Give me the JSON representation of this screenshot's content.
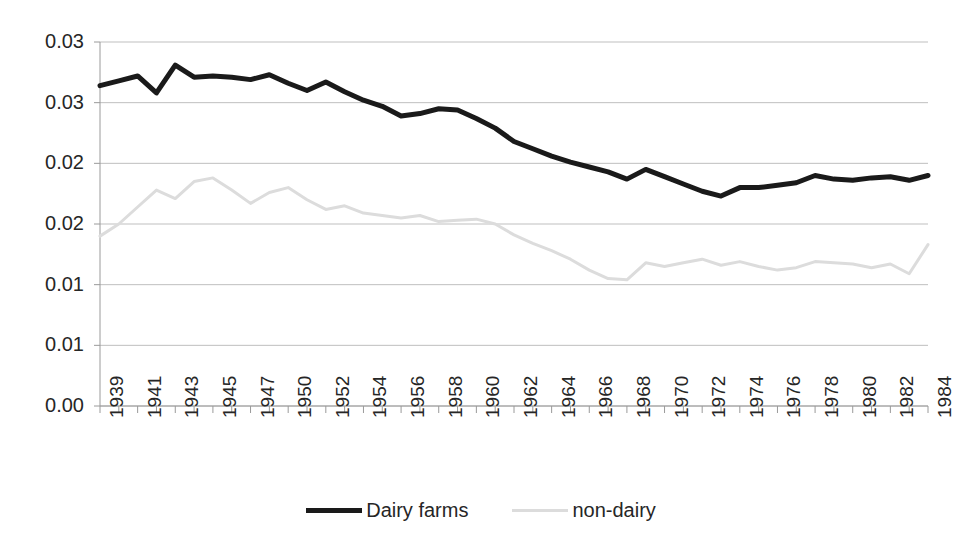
{
  "chart_data": {
    "type": "line",
    "title": "",
    "subtitle": "",
    "xlabel": "",
    "ylabel": "",
    "grid": true,
    "legend_position": "bottom",
    "ylim": [
      0.0,
      0.03
    ],
    "y_ticks": [
      0.0,
      0.005,
      0.01,
      0.015,
      0.02,
      0.025,
      0.03
    ],
    "y_tick_labels": [
      "0.00",
      "0.01",
      "0.01",
      "0.02",
      "0.02",
      "0.03",
      "0.03"
    ],
    "y_tick_labels_top_to_bottom": [
      "0.03",
      "0.03",
      "0.02",
      "0.02",
      "0.01",
      "0.01",
      "0.00"
    ],
    "categories": [
      "1939",
      "1940",
      "1941",
      "1942",
      "1943",
      "1944",
      "1945",
      "1946",
      "1947",
      "1948",
      "1950",
      "1951",
      "1952",
      "1953",
      "1954",
      "1955",
      "1956",
      "1957",
      "1958",
      "1959",
      "1960",
      "1961",
      "1962",
      "1963",
      "1964",
      "1965",
      "1966",
      "1967",
      "1968",
      "1969",
      "1970",
      "1971",
      "1972",
      "1973",
      "1974",
      "1975",
      "1976",
      "1977",
      "1978",
      "1979",
      "1980",
      "1981",
      "1982",
      "1983",
      "1984"
    ],
    "x_tick_labels_shown": [
      "1939",
      "1941",
      "1943",
      "1945",
      "1947",
      "1950",
      "1952",
      "1954",
      "1956",
      "1958",
      "1960",
      "1962",
      "1964",
      "1966",
      "1968",
      "1970",
      "1972",
      "1974",
      "1976",
      "1978",
      "1980",
      "1982",
      "1984"
    ],
    "series": [
      {
        "name": "Dairy farms",
        "color": "#1a1a1a",
        "width": 5,
        "values": [
          0.0264,
          0.0268,
          0.0272,
          0.0258,
          0.0281,
          0.0271,
          0.0272,
          0.0271,
          0.0269,
          0.0273,
          0.0266,
          0.026,
          0.0267,
          0.0259,
          0.0252,
          0.0247,
          0.0239,
          0.0241,
          0.0245,
          0.0244,
          0.0237,
          0.0229,
          0.0218,
          0.0212,
          0.0206,
          0.0201,
          0.0197,
          0.0193,
          0.0187,
          0.0195,
          0.0189,
          0.0183,
          0.0177,
          0.0173,
          0.018,
          0.018,
          0.0182,
          0.0184,
          0.019,
          0.0187,
          0.0186,
          0.0188,
          0.0189,
          0.0186,
          0.019
        ]
      },
      {
        "name": "non-dairy",
        "color": "#dcdcdc",
        "width": 3,
        "values": [
          0.014,
          0.015,
          0.0164,
          0.0178,
          0.0171,
          0.0185,
          0.0188,
          0.0178,
          0.0167,
          0.0176,
          0.018,
          0.017,
          0.0162,
          0.0165,
          0.0159,
          0.0157,
          0.0155,
          0.0157,
          0.0152,
          0.0153,
          0.0154,
          0.015,
          0.0141,
          0.0134,
          0.0128,
          0.0121,
          0.0112,
          0.0105,
          0.0104,
          0.0118,
          0.0115,
          0.0118,
          0.0121,
          0.0116,
          0.0119,
          0.0115,
          0.0112,
          0.0114,
          0.0119,
          0.0118,
          0.0117,
          0.0114,
          0.0117,
          0.0109,
          0.0133
        ]
      }
    ],
    "legend": [
      {
        "label": "Dairy farms",
        "color": "#1a1a1a"
      },
      {
        "label": "non-dairy",
        "color": "#dcdcdc"
      }
    ]
  },
  "colors": {
    "background": "#ffffff",
    "axis": "#9a9a9a",
    "grid": "#bfbfbf",
    "text": "#262626",
    "dairy": "#1a1a1a",
    "non_dairy": "#dcdcdc"
  }
}
